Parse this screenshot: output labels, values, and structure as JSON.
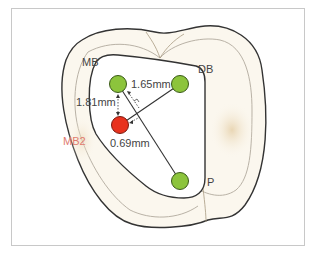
{
  "diagram": {
    "title": "",
    "canals": [
      {
        "id": "MB",
        "label": "MB",
        "color": "#8cc43c",
        "cx": 118,
        "cy": 84
      },
      {
        "id": "DB",
        "label": "DB",
        "color": "#8cc43c",
        "cx": 180,
        "cy": 84
      },
      {
        "id": "MB2",
        "label": "MB2",
        "color": "#e8321e",
        "cx": 120,
        "cy": 125
      },
      {
        "id": "P",
        "label": "P",
        "color": "#8cc43c",
        "cx": 180,
        "cy": 181
      }
    ],
    "measurements": {
      "mb_db": "1.65mm",
      "mb_mb2": "1.81mm",
      "mb2_line": "0.69mm"
    },
    "labels": {
      "mb": "MB",
      "db": "DB",
      "mb2": "MB2",
      "p": "P"
    },
    "colors": {
      "canal_green": "#8cc43c",
      "canal_red": "#e8321e",
      "outline": "#333333",
      "tooth_fill": "#fbf7ee",
      "mb2_label": "#e07a6e"
    }
  }
}
